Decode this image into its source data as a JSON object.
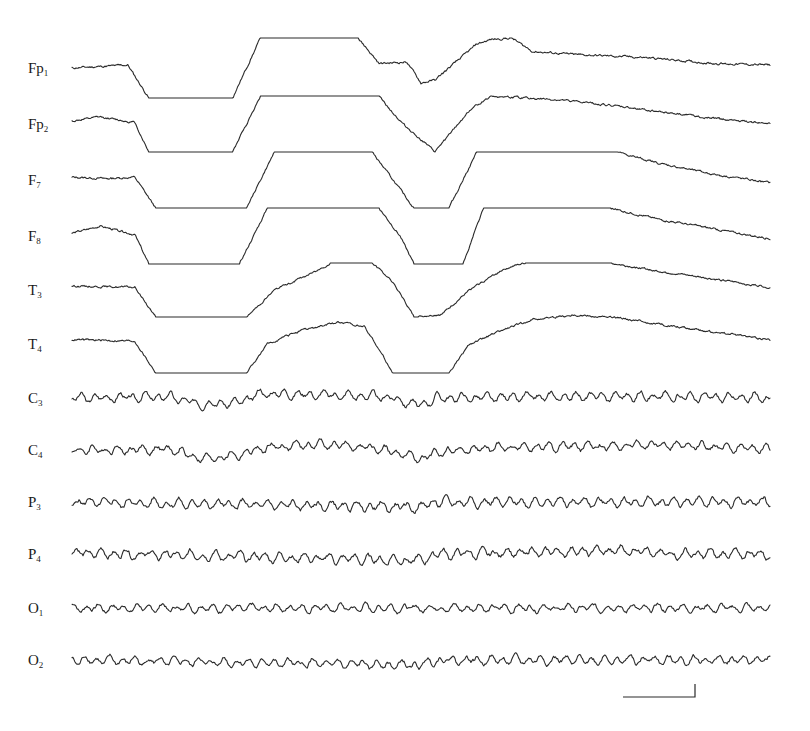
{
  "chart_data": {
    "type": "line",
    "title": "",
    "xlabel": "",
    "ylabel": "",
    "grid": false,
    "legend": "none",
    "x_range": [
      0,
      1
    ],
    "note": "12-channel EEG recording; frontal/temporal channels show large slow deflections that clip into flat plateaus (amplifier saturation); central/parietal/occipital channels show ongoing rhythmic activity with a shared sharp transient near x=0.50",
    "channels": [
      {
        "name": "Fp",
        "sub": "1",
        "kind": "clipped",
        "clip": 1.0,
        "profile": [
          [
            0,
            0
          ],
          [
            0.08,
            0.1
          ],
          [
            0.11,
            -1
          ],
          [
            0.23,
            -1
          ],
          [
            0.27,
            1
          ],
          [
            0.41,
            1
          ],
          [
            0.44,
            0.15
          ],
          [
            0.48,
            0.2
          ],
          [
            0.5,
            -0.5
          ],
          [
            0.52,
            -0.4
          ],
          [
            0.58,
            0.8
          ],
          [
            0.6,
            0.95
          ],
          [
            0.63,
            1
          ],
          [
            0.66,
            0.55
          ],
          [
            0.72,
            0.45
          ],
          [
            0.82,
            0.35
          ],
          [
            0.92,
            0.15
          ],
          [
            1,
            0.1
          ]
        ]
      },
      {
        "name": "Fp",
        "sub": "2",
        "kind": "clipped",
        "clip": 1.0,
        "profile": [
          [
            0,
            0.1
          ],
          [
            0.04,
            0.25
          ],
          [
            0.09,
            0.05
          ],
          [
            0.11,
            -1
          ],
          [
            0.23,
            -1
          ],
          [
            0.27,
            1
          ],
          [
            0.44,
            1
          ],
          [
            0.47,
            0.1
          ],
          [
            0.52,
            -1
          ],
          [
            0.57,
            0.5
          ],
          [
            0.6,
            1
          ],
          [
            0.7,
            0.85
          ],
          [
            0.76,
            0.7
          ],
          [
            0.84,
            0.45
          ],
          [
            0.92,
            0.2
          ],
          [
            1,
            0.0
          ]
        ]
      },
      {
        "name": "F",
        "sub": "7",
        "kind": "clipped",
        "clip": 1.0,
        "profile": [
          [
            0,
            0.1
          ],
          [
            0.05,
            0.05
          ],
          [
            0.09,
            0.1
          ],
          [
            0.12,
            -1
          ],
          [
            0.25,
            -1
          ],
          [
            0.29,
            1
          ],
          [
            0.43,
            1
          ],
          [
            0.46,
            0.0
          ],
          [
            0.49,
            -1
          ],
          [
            0.54,
            -1
          ],
          [
            0.58,
            1
          ],
          [
            0.78,
            1
          ],
          [
            0.84,
            0.6
          ],
          [
            0.92,
            0.2
          ],
          [
            1,
            -0.1
          ]
        ]
      },
      {
        "name": "F",
        "sub": "8",
        "kind": "clipped",
        "clip": 1.0,
        "profile": [
          [
            0,
            0.1
          ],
          [
            0.04,
            0.35
          ],
          [
            0.09,
            0.05
          ],
          [
            0.11,
            -1
          ],
          [
            0.24,
            -1
          ],
          [
            0.28,
            1
          ],
          [
            0.44,
            1
          ],
          [
            0.47,
            0.0
          ],
          [
            0.49,
            -1
          ],
          [
            0.56,
            -1
          ],
          [
            0.59,
            1
          ],
          [
            0.77,
            1
          ],
          [
            0.84,
            0.6
          ],
          [
            0.92,
            0.25
          ],
          [
            1,
            -0.1
          ]
        ]
      },
      {
        "name": "T",
        "sub": "3",
        "kind": "clipped",
        "clip": 1.0,
        "profile": [
          [
            0,
            0.15
          ],
          [
            0.09,
            0.1
          ],
          [
            0.12,
            -1
          ],
          [
            0.25,
            -1
          ],
          [
            0.29,
            0
          ],
          [
            0.35,
            0.7
          ],
          [
            0.37,
            1
          ],
          [
            0.43,
            1
          ],
          [
            0.46,
            0.3
          ],
          [
            0.49,
            -1
          ],
          [
            0.53,
            -0.9
          ],
          [
            0.57,
            0.0
          ],
          [
            0.62,
            0.8
          ],
          [
            0.65,
            1
          ],
          [
            0.77,
            1
          ],
          [
            0.84,
            0.7
          ],
          [
            0.92,
            0.4
          ],
          [
            1,
            0.1
          ]
        ]
      },
      {
        "name": "T",
        "sub": "4",
        "kind": "clipped",
        "clip": 1.0,
        "profile": [
          [
            0,
            0.15
          ],
          [
            0.09,
            0.1
          ],
          [
            0.12,
            -1
          ],
          [
            0.25,
            -1
          ],
          [
            0.28,
            0
          ],
          [
            0.32,
            0.4
          ],
          [
            0.38,
            0.75
          ],
          [
            0.42,
            0.6
          ],
          [
            0.44,
            -0.2
          ],
          [
            0.46,
            -1
          ],
          [
            0.54,
            -1
          ],
          [
            0.57,
            0.0
          ],
          [
            0.62,
            0.5
          ],
          [
            0.66,
            0.85
          ],
          [
            0.72,
            1
          ],
          [
            0.78,
            0.9
          ],
          [
            0.88,
            0.55
          ],
          [
            1,
            0.15
          ]
        ]
      },
      {
        "name": "C",
        "sub": "3",
        "kind": "rhythmic",
        "amp": 0.55,
        "seed": 3,
        "profile": [
          [
            0,
            0
          ],
          [
            0.14,
            0.1
          ],
          [
            0.18,
            -0.45
          ],
          [
            0.24,
            -0.35
          ],
          [
            0.27,
            0.35
          ],
          [
            0.33,
            0.3
          ],
          [
            0.45,
            0.1
          ],
          [
            0.5,
            -0.6
          ],
          [
            0.52,
            0
          ],
          [
            0.7,
            0.1
          ],
          [
            0.8,
            0.15
          ],
          [
            1,
            0
          ]
        ]
      },
      {
        "name": "C",
        "sub": "4",
        "kind": "rhythmic",
        "amp": 0.55,
        "seed": 4,
        "profile": [
          [
            0,
            0
          ],
          [
            0.14,
            0.05
          ],
          [
            0.19,
            -0.7
          ],
          [
            0.24,
            -0.35
          ],
          [
            0.28,
            0.2
          ],
          [
            0.36,
            0.45
          ],
          [
            0.44,
            0.1
          ],
          [
            0.5,
            -0.7
          ],
          [
            0.53,
            -0.1
          ],
          [
            0.62,
            0.2
          ],
          [
            0.78,
            0.3
          ],
          [
            0.82,
            0.45
          ],
          [
            1,
            0.1
          ]
        ]
      },
      {
        "name": "P",
        "sub": "3",
        "kind": "rhythmic",
        "amp": 0.6,
        "seed": 5,
        "profile": [
          [
            0,
            0
          ],
          [
            0.5,
            -0.4
          ],
          [
            0.52,
            0
          ],
          [
            1,
            0
          ]
        ]
      },
      {
        "name": "P",
        "sub": "4",
        "kind": "rhythmic",
        "amp": 0.6,
        "seed": 6,
        "profile": [
          [
            0,
            0.1
          ],
          [
            0.5,
            -0.5
          ],
          [
            0.52,
            0
          ],
          [
            0.82,
            0.3
          ],
          [
            0.84,
            0
          ],
          [
            1,
            0
          ]
        ]
      },
      {
        "name": "O",
        "sub": "1",
        "kind": "rhythmic",
        "amp": 0.5,
        "seed": 7,
        "profile": [
          [
            0,
            0
          ],
          [
            1,
            0
          ]
        ]
      },
      {
        "name": "O",
        "sub": "2",
        "kind": "rhythmic",
        "amp": 0.55,
        "seed": 8,
        "profile": [
          [
            0,
            0
          ],
          [
            0.5,
            -0.4
          ],
          [
            0.52,
            0
          ],
          [
            1,
            0
          ]
        ]
      }
    ],
    "scale_bar": {
      "visible": true,
      "label": ""
    }
  }
}
